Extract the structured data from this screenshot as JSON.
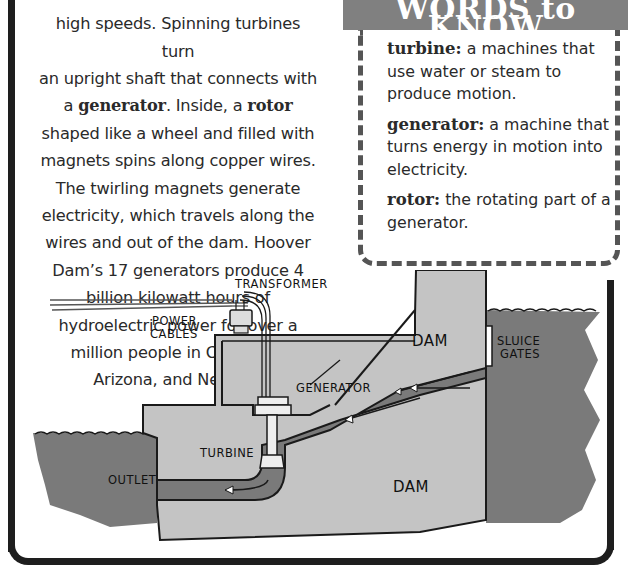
{
  "body_text": {
    "line0": "high speeds. Spinning turbines turn",
    "line1_pre": "an upright shaft that connects with a ",
    "term_generator": "generator",
    "line2_mid": ". Inside, a ",
    "term_rotor": "rotor",
    "line2_post": " shaped like a wheel and filled with magnets spins along copper wires. The twirling magnets generate electricity, which travels along the wires and out of the dam. Hoover Dam’s 17 generators produce 4 billion kilowatt hours of hydroelectric power for over a million people in California, Arizona, and Nevada."
  },
  "words_to_know": {
    "title": "WORDS to KNOW",
    "entries": [
      {
        "term": "turbine:",
        "definition": " a machines that use water or steam to produce motion."
      },
      {
        "term": "generator:",
        "definition": " a machine that turns energy in motion into electricity."
      },
      {
        "term": "rotor:",
        "definition": " the rotating part of a generator."
      }
    ]
  },
  "diagram": {
    "labels": {
      "transformer": "TRANSFORMER",
      "power_cables_1": "POWER",
      "power_cables_2": "CABLES",
      "dam_top": "DAM",
      "sluice_1": "SLUICE",
      "sluice_2": "GATES",
      "generator": "GENERATOR",
      "turbine": "TURBINE",
      "outlet": "OUTLET",
      "dam_bottom": "DAM"
    },
    "colors": {
      "water": "#7a7a7a",
      "concrete": "#c4c4c4",
      "outline": "#1a1a1a",
      "header_bg": "#808080"
    }
  }
}
